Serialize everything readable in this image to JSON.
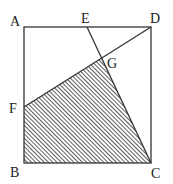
{
  "diagram": {
    "labels": {
      "A": "A",
      "B": "B",
      "C": "C",
      "D": "D",
      "E": "E",
      "F": "F",
      "G": "G"
    },
    "points": {
      "A": [
        24,
        27
      ],
      "B": [
        24,
        163
      ],
      "C": [
        151,
        163
      ],
      "D": [
        151,
        27
      ],
      "E": [
        87,
        27
      ],
      "F": [
        24,
        107
      ],
      "G": [
        102,
        58
      ]
    },
    "segments": [
      [
        "A",
        "B"
      ],
      [
        "B",
        "C"
      ],
      [
        "C",
        "D"
      ],
      [
        "D",
        "A"
      ],
      [
        "E",
        "C"
      ],
      [
        "F",
        "D"
      ]
    ],
    "shaded_region": [
      "F",
      "G",
      "C",
      "B"
    ],
    "colors": {
      "stroke": "#333333",
      "hatch": "#333333",
      "label": "#222222"
    }
  }
}
